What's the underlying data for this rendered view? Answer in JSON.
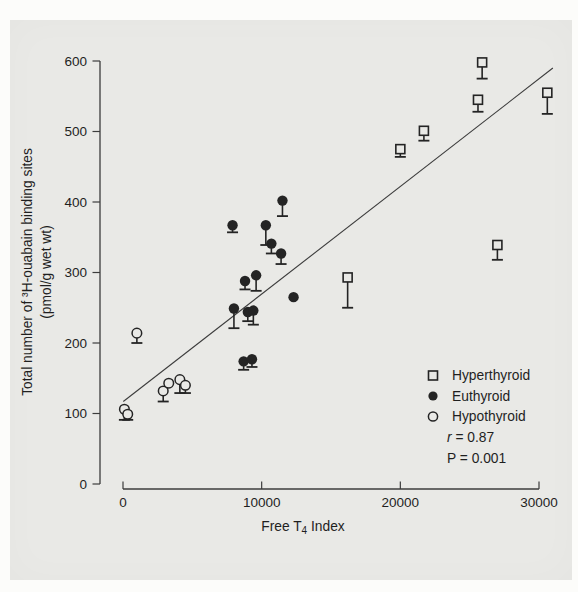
{
  "figure": {
    "background": "#e9e9e6",
    "ink": "#242424",
    "line_color": "#3c3c3c"
  },
  "chart_data": {
    "type": "scatter",
    "xlabel_parts": {
      "pre": "Free T",
      "sub": "4",
      "post": " Index"
    },
    "ylabel_line1": "Total number of ³H-ouabain binding sites",
    "ylabel_line2": "(pmol/g wet wt)",
    "xlim": [
      0,
      30000
    ],
    "ylim": [
      0,
      600
    ],
    "x_ticks": [
      0,
      10000,
      20000,
      30000
    ],
    "y_ticks": [
      0,
      100,
      200,
      300,
      400,
      500,
      600
    ],
    "regression_line": {
      "x1": 20,
      "y1": 117,
      "x2": 31000,
      "y2": 590
    },
    "stats": {
      "r_symbol": "r",
      "r_text": " = 0.87",
      "p_text": "P = 0.001"
    },
    "series": [
      {
        "name": "Hyperthyroid",
        "marker": "open-square",
        "points": [
          {
            "x": 25900,
            "y": 598,
            "err": 575
          },
          {
            "x": 25600,
            "y": 545,
            "err": 528
          },
          {
            "x": 30600,
            "y": 555,
            "err": 525
          },
          {
            "x": 21700,
            "y": 501,
            "err": 487
          },
          {
            "x": 20000,
            "y": 475,
            "err": 464
          },
          {
            "x": 27000,
            "y": 339,
            "err": 318
          },
          {
            "x": 16200,
            "y": 293,
            "err": 250
          }
        ]
      },
      {
        "name": "Euthyroid",
        "marker": "filled-circle",
        "points": [
          {
            "x": 11500,
            "y": 402,
            "err": 380
          },
          {
            "x": 7900,
            "y": 367,
            "err": 357
          },
          {
            "x": 10300,
            "y": 367,
            "err": 339
          },
          {
            "x": 10700,
            "y": 341,
            "err": 327
          },
          {
            "x": 11400,
            "y": 327,
            "err": 312
          },
          {
            "x": 9600,
            "y": 296,
            "err": 274
          },
          {
            "x": 8800,
            "y": 288,
            "err": 276
          },
          {
            "x": 12300,
            "y": 265
          },
          {
            "x": 8000,
            "y": 249,
            "err": 221
          },
          {
            "x": 9000,
            "y": 244,
            "err": 231
          },
          {
            "x": 9400,
            "y": 246,
            "err": 226
          },
          {
            "x": 8700,
            "y": 174,
            "err": 162
          },
          {
            "x": 9300,
            "y": 177,
            "err": 166
          }
        ]
      },
      {
        "name": "Hypothyroid",
        "marker": "open-circle",
        "points": [
          {
            "x": 1000,
            "y": 214,
            "err": 200
          },
          {
            "x": 100,
            "y": 106,
            "err": 91
          },
          {
            "x": 340,
            "y": 99,
            "err": 91
          },
          {
            "x": 2900,
            "y": 132,
            "err": 117
          },
          {
            "x": 3300,
            "y": 143
          },
          {
            "x": 4100,
            "y": 148,
            "err": 129
          },
          {
            "x": 4500,
            "y": 140,
            "err": 129
          }
        ]
      }
    ],
    "legend": {
      "position": "bottom-right",
      "entries": [
        "Hyperthyroid",
        "Euthyroid",
        "Hypothyroid"
      ]
    }
  }
}
